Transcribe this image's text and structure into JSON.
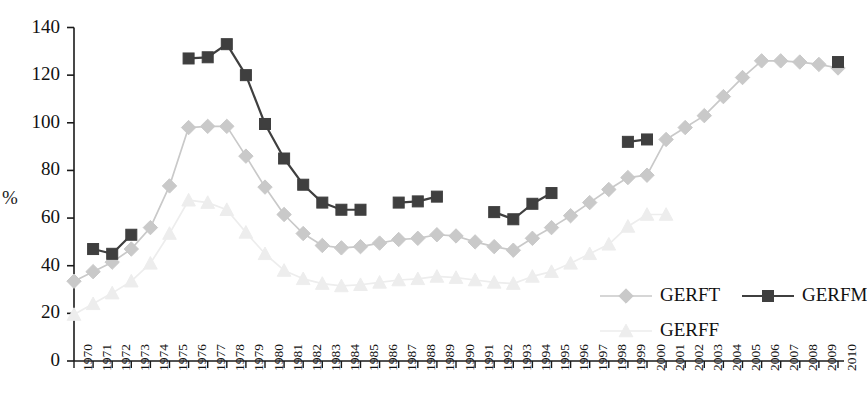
{
  "chart_data": {
    "type": "line",
    "title": "",
    "xlabel": "",
    "ylabel": "%",
    "ylim": [
      0,
      140
    ],
    "yticks": [
      0,
      20,
      40,
      60,
      80,
      100,
      120,
      140
    ],
    "grid": false,
    "legend_position": "bottom-right",
    "x": [
      1970,
      1971,
      1972,
      1973,
      1974,
      1975,
      1976,
      1977,
      1978,
      1979,
      1980,
      1981,
      1982,
      1983,
      1984,
      1985,
      1986,
      1987,
      1988,
      1989,
      1990,
      1991,
      1992,
      1993,
      1994,
      1995,
      1996,
      1997,
      1998,
      1999,
      2000,
      2001,
      2002,
      2003,
      2004,
      2005,
      2006,
      2007,
      2008,
      2009,
      2010
    ],
    "categories": [
      "1970",
      "1971",
      "1972",
      "1973",
      "1974",
      "1975",
      "1976",
      "1977",
      "1978",
      "1979",
      "1980",
      "1981",
      "1982",
      "1983",
      "1984",
      "1985",
      "1986",
      "1987",
      "1988",
      "1989",
      "1990",
      "1991",
      "1992",
      "1993",
      "1994",
      "1995",
      "1996",
      "1997",
      "1998",
      "1999",
      "2000",
      "2001",
      "2002",
      "2003",
      "2004",
      "2005",
      "2006",
      "2007",
      "2008",
      "2009",
      "2010"
    ],
    "series": [
      {
        "name": "GERFT",
        "color": "#c9c9c9",
        "marker": "diamond",
        "values": [
          33.5,
          37.5,
          41.5,
          47.0,
          56.0,
          73.5,
          98.0,
          98.5,
          98.5,
          86.0,
          73.0,
          61.5,
          53.5,
          48.5,
          47.5,
          48.0,
          49.5,
          51.0,
          51.5,
          53.0,
          52.5,
          50.0,
          48.0,
          46.5,
          51.5,
          56.0,
          61.0,
          66.5,
          72.0,
          77.0,
          78.0,
          93.0,
          98.0,
          103.0,
          111.0,
          119.0,
          126.0,
          126.0,
          125.5,
          124.5,
          123.0
        ]
      },
      {
        "name": "GERFM",
        "color": "#3f3f3f",
        "marker": "square",
        "values": [
          null,
          47.0,
          45.0,
          53.0,
          null,
          null,
          127.0,
          127.5,
          133.0,
          120.0,
          99.5,
          85.0,
          74.0,
          66.5,
          63.5,
          63.5,
          null,
          66.5,
          67.0,
          69.0,
          null,
          null,
          62.5,
          59.5,
          66.0,
          70.5,
          null,
          null,
          null,
          92.0,
          93.0,
          null,
          null,
          null,
          null,
          null,
          null,
          null,
          null,
          null,
          125.5
        ]
      },
      {
        "name": "GERFF",
        "color": "#ededed",
        "marker": "triangle",
        "values": [
          19.5,
          24.0,
          28.5,
          33.5,
          41.0,
          53.5,
          67.5,
          66.5,
          63.5,
          54.0,
          45.0,
          38.0,
          34.5,
          32.5,
          31.5,
          32.0,
          33.0,
          34.0,
          34.5,
          35.5,
          35.0,
          34.0,
          33.0,
          32.5,
          35.5,
          37.5,
          41.0,
          45.0,
          49.0,
          56.5,
          61.5,
          61.5,
          null,
          null,
          null,
          null,
          null,
          null,
          null,
          null,
          null
        ]
      }
    ]
  },
  "legend": {
    "entries": [
      {
        "label": "GERFT",
        "color": "#c9c9c9",
        "marker": "diamond"
      },
      {
        "label": "GERFM",
        "color": "#3f3f3f",
        "marker": "square"
      },
      {
        "label": "GERFF",
        "color": "#ededed",
        "marker": "triangle"
      }
    ]
  },
  "axes": {
    "y_axis_title": "%",
    "y_tick_labels": [
      "140",
      "120",
      "100",
      "80",
      "60",
      "40",
      "20",
      "0"
    ],
    "x_tick_labels": [
      "1970",
      "1971",
      "1972",
      "1973",
      "1974",
      "1975",
      "1976",
      "1977",
      "1978",
      "1979",
      "1980",
      "1981",
      "1982",
      "1983",
      "1984",
      "1985",
      "1986",
      "1987",
      "1988",
      "1989",
      "1990",
      "1991",
      "1992",
      "1993",
      "1994",
      "1995",
      "1996",
      "1997",
      "1998",
      "1999",
      "2000",
      "2001",
      "2002",
      "2003",
      "2004",
      "2005",
      "2006",
      "2007",
      "2008",
      "2009",
      "2010"
    ]
  }
}
